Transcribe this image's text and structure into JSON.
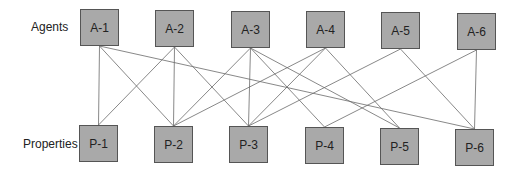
{
  "labels": {
    "agents": "Agents",
    "properties": "Properties"
  },
  "agents": [
    {
      "id": "A-1",
      "label": "A-1",
      "x": 80,
      "y": 9
    },
    {
      "id": "A-2",
      "label": "A-2",
      "x": 155,
      "y": 10
    },
    {
      "id": "A-3",
      "label": "A-3",
      "x": 231,
      "y": 11
    },
    {
      "id": "A-4",
      "label": "A-4",
      "x": 306,
      "y": 11
    },
    {
      "id": "A-5",
      "label": "A-5",
      "x": 381,
      "y": 12
    },
    {
      "id": "A-6",
      "label": "A-6",
      "x": 457,
      "y": 13
    }
  ],
  "properties": [
    {
      "id": "P-1",
      "label": "P-1",
      "x": 79,
      "y": 125
    },
    {
      "id": "P-2",
      "label": "P-2",
      "x": 154,
      "y": 126
    },
    {
      "id": "P-3",
      "label": "P-3",
      "x": 229,
      "y": 126
    },
    {
      "id": "P-4",
      "label": "P-4",
      "x": 305,
      "y": 127
    },
    {
      "id": "P-5",
      "label": "P-5",
      "x": 380,
      "y": 128
    },
    {
      "id": "P-6",
      "label": "P-6",
      "x": 455,
      "y": 129
    }
  ],
  "edges": [
    [
      "A-1",
      "P-1"
    ],
    [
      "A-1",
      "P-2"
    ],
    [
      "A-1",
      "P-6"
    ],
    [
      "A-2",
      "P-1"
    ],
    [
      "A-2",
      "P-2"
    ],
    [
      "A-2",
      "P-3"
    ],
    [
      "A-3",
      "P-2"
    ],
    [
      "A-3",
      "P-3"
    ],
    [
      "A-3",
      "P-4"
    ],
    [
      "A-3",
      "P-5"
    ],
    [
      "A-4",
      "P-2"
    ],
    [
      "A-4",
      "P-3"
    ],
    [
      "A-4",
      "P-5"
    ],
    [
      "A-5",
      "P-3"
    ],
    [
      "A-5",
      "P-6"
    ],
    [
      "A-6",
      "P-4"
    ],
    [
      "A-6",
      "P-6"
    ]
  ],
  "colors": {
    "node_fill": "#a9a9a9",
    "node_border": "#555555",
    "edge": "#6a6a6a"
  }
}
